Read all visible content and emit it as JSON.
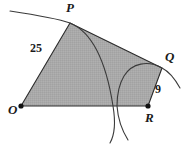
{
  "figure": {
    "background_color": "#ffffff",
    "fill_color": "#a8a8a8",
    "stroke_color": "#2b2b2b",
    "arc_color": "#3a3a3a",
    "vertices": [
      {
        "name": "O",
        "label": "O",
        "x": 21,
        "y": 106
      },
      {
        "name": "P",
        "label": "P",
        "x": 70,
        "y": 23
      },
      {
        "name": "Q",
        "label": "Q",
        "x": 162,
        "y": 68
      },
      {
        "name": "R",
        "label": "R",
        "x": 148,
        "y": 106
      }
    ],
    "edge_labels": [
      {
        "name": "OP",
        "label": "25",
        "x": 30,
        "y": 42
      },
      {
        "name": "RQ",
        "label": "9",
        "x": 155,
        "y": 83
      }
    ],
    "arcs": [
      {
        "name": "arc-centered-at-O",
        "center": "O",
        "radius_label": "25",
        "through_vertex": "P",
        "path": "M 10 11 C 30 14 56 18 70 23 C 92 32 106 61 113 106 C 116 124 114 136 110 143"
      },
      {
        "name": "arc-centered-at-R",
        "center": "R",
        "radius_label": "9",
        "through_vertex": "Q",
        "path": "M 180 88 C 175 79 170 72 162 68 C 148 60 132 63 124 76 C 118 86 117 96 117 106 C 118 120 123 132 128 140"
      }
    ],
    "polygon_path": "M 21 106 L 70 23 L 162 68 L 148 106 Z"
  }
}
